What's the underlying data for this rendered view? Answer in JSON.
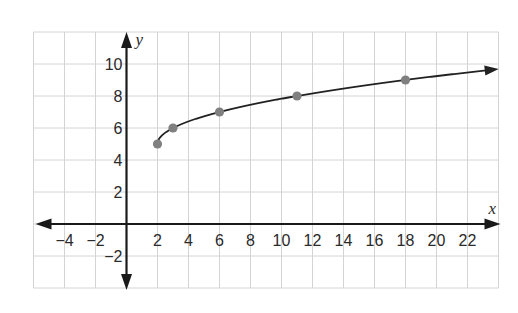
{
  "chart_data": {
    "type": "line",
    "title": "",
    "xlabel": "x",
    "ylabel": "y",
    "xlim": [
      -6,
      24
    ],
    "ylim": [
      -4,
      12
    ],
    "grid": true,
    "grid_step": 2,
    "x_ticks": [
      -4,
      -2,
      2,
      4,
      6,
      8,
      10,
      12,
      14,
      16,
      18,
      20,
      22
    ],
    "y_ticks": [
      -2,
      2,
      4,
      6,
      8,
      10
    ],
    "x_tick_labels": [
      "−4",
      "−2",
      "2",
      "4",
      "6",
      "8",
      "10",
      "12",
      "14",
      "16",
      "18",
      "20",
      "22"
    ],
    "y_tick_labels": [
      "−2",
      "2",
      "4",
      "6",
      "8",
      "10"
    ],
    "series": [
      {
        "name": "curve",
        "description": "y = sqrt(x - 2) + 5, starting at (2,5) with arrow to the right",
        "points": [
          {
            "x": 2,
            "y": 5
          },
          {
            "x": 3,
            "y": 6
          },
          {
            "x": 6,
            "y": 7
          },
          {
            "x": 11,
            "y": 8
          },
          {
            "x": 18,
            "y": 9
          }
        ],
        "curve_end_x": 23.5,
        "color": "#222222",
        "marker_color": "#808080"
      }
    ]
  },
  "colors": {
    "grid": "#d4d4d4",
    "axis": "#1a1a1a",
    "curve": "#222222",
    "marker": "#808080"
  }
}
